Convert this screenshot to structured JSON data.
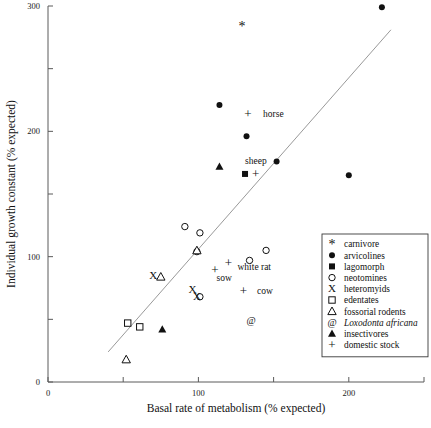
{
  "chart_data": {
    "type": "scatter",
    "title": "",
    "xlabel": "Basal rate of metabolism (% expected)",
    "ylabel": "Individual growth constant (% expected)",
    "xlim": [
      0,
      250
    ],
    "ylim": [
      0,
      300
    ],
    "xticks": [
      0,
      50,
      100,
      150,
      200,
      250
    ],
    "xticklabels": [
      "0",
      "",
      "100",
      "",
      "200",
      ""
    ],
    "yticks": [
      0,
      50,
      100,
      150,
      200,
      250,
      300
    ],
    "yticklabels": [
      "0",
      "",
      "100",
      "",
      "200",
      "",
      "300"
    ],
    "grid": false,
    "legend_position": "lower right",
    "trendline": {
      "x0": 40,
      "y0": 24,
      "x1": 228,
      "y1": 281
    },
    "series": [
      {
        "name": "carnivore",
        "marker": "asterisk",
        "points": [
          {
            "x": 129,
            "y": 284
          }
        ]
      },
      {
        "name": "arvicolines",
        "marker": "filled-circle",
        "points": [
          {
            "x": 114,
            "y": 221
          },
          {
            "x": 132,
            "y": 196
          },
          {
            "x": 152,
            "y": 176
          },
          {
            "x": 200,
            "y": 165
          },
          {
            "x": 222,
            "y": 299
          }
        ]
      },
      {
        "name": "lagomorph",
        "marker": "filled-square",
        "points": [
          {
            "x": 131,
            "y": 166
          }
        ]
      },
      {
        "name": "neotomines",
        "marker": "open-circle",
        "points": [
          {
            "x": 91,
            "y": 124
          },
          {
            "x": 101,
            "y": 119
          },
          {
            "x": 99,
            "y": 104
          },
          {
            "x": 134,
            "y": 97
          },
          {
            "x": 145,
            "y": 105
          },
          {
            "x": 101,
            "y": 68
          }
        ]
      },
      {
        "name": "heteromyids",
        "marker": "x-cross",
        "points": [
          {
            "x": 70,
            "y": 85
          },
          {
            "x": 96,
            "y": 74
          },
          {
            "x": 99,
            "y": 68
          }
        ]
      },
      {
        "name": "edentates",
        "marker": "open-square",
        "points": [
          {
            "x": 53,
            "y": 47
          },
          {
            "x": 61,
            "y": 44
          }
        ]
      },
      {
        "name": "fossorial rodents",
        "marker": "open-triangle",
        "points": [
          {
            "x": 75,
            "y": 84
          },
          {
            "x": 99,
            "y": 105
          },
          {
            "x": 52,
            "y": 18
          }
        ]
      },
      {
        "name": "Loxodonta africana",
        "marker": "at-sign",
        "points": [
          {
            "x": 135,
            "y": 49
          }
        ]
      },
      {
        "name": "insectivores",
        "marker": "filled-triangle",
        "points": [
          {
            "x": 114,
            "y": 172
          },
          {
            "x": 76,
            "y": 42
          }
        ]
      },
      {
        "name": "domestic stock",
        "marker": "plus",
        "points": [
          {
            "x": 133,
            "y": 214
          },
          {
            "x": 138,
            "y": 166
          },
          {
            "x": 111,
            "y": 90
          },
          {
            "x": 120,
            "y": 95
          },
          {
            "x": 130,
            "y": 73
          }
        ]
      }
    ],
    "annotations": [
      {
        "text": "horse",
        "x": 143,
        "y": 214
      },
      {
        "text": "sheep",
        "x": 131,
        "y": 177
      },
      {
        "text": "white rat",
        "x": 126,
        "y": 92
      },
      {
        "text": "sow",
        "x": 112,
        "y": 83
      },
      {
        "text": "cow",
        "x": 139,
        "y": 73
      }
    ]
  },
  "legend": {
    "items": [
      {
        "marker": "asterisk",
        "label": "carnivore",
        "italic": false
      },
      {
        "marker": "filled-circle",
        "label": "arvicolines",
        "italic": false
      },
      {
        "marker": "filled-square",
        "label": "lagomorph",
        "italic": false
      },
      {
        "marker": "open-circle",
        "label": "neotomines",
        "italic": false
      },
      {
        "marker": "x-cross",
        "label": "heteromyids",
        "italic": false
      },
      {
        "marker": "open-square",
        "label": "edentates",
        "italic": false
      },
      {
        "marker": "open-triangle",
        "label": "fossorial rodents",
        "italic": false
      },
      {
        "marker": "at-sign",
        "label": "Loxodonta africana",
        "italic": true
      },
      {
        "marker": "filled-triangle",
        "label": "insectivores",
        "italic": false
      },
      {
        "marker": "plus",
        "label": "domestic stock",
        "italic": false
      }
    ]
  },
  "colors": {
    "ink": "#111111",
    "axis": "#5a5a5a",
    "trendline": "#8d8d8d",
    "background": "#ffffff"
  }
}
